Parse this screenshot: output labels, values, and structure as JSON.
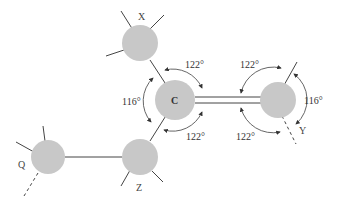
{
  "diagram": {
    "type": "molecular-geometry",
    "atoms": [
      {
        "id": "X",
        "label": "X"
      },
      {
        "id": "C",
        "label": "C"
      },
      {
        "id": "Y",
        "label": "Y"
      },
      {
        "id": "Q",
        "label": "Q"
      },
      {
        "id": "Z",
        "label": "Z"
      }
    ],
    "bonds": [
      {
        "from": "X",
        "to": "C",
        "type": "single"
      },
      {
        "from": "C",
        "to": "Z",
        "type": "single"
      },
      {
        "from": "C",
        "to": "Y",
        "type": "double"
      },
      {
        "from": "Q",
        "to": "Z",
        "type": "single"
      }
    ],
    "angles": {
      "c_top": "122°",
      "c_left": "116°",
      "c_bottom": "122°",
      "y_top": "122°",
      "y_right": "116°",
      "y_bottom": "122°"
    },
    "colors": {
      "atom_fill": "#c8c8c8",
      "line": "#444444"
    }
  }
}
